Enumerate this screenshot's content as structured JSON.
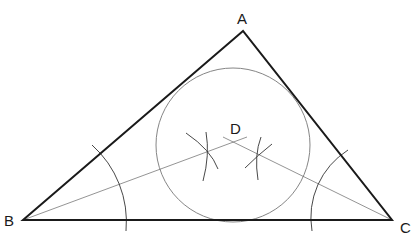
{
  "diagram": {
    "labels": {
      "A": "A",
      "B": "B",
      "C": "C",
      "D": "D"
    },
    "colors": {
      "background": "#ffffff",
      "triangle": "#1a1a1a",
      "construction": "#555555",
      "circle": "#777777"
    }
  }
}
